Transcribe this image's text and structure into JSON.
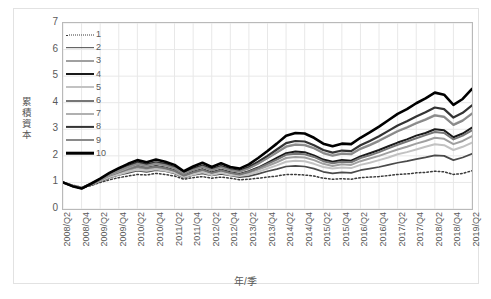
{
  "chart_data": {
    "type": "line",
    "title": "",
    "xlabel": "年/季",
    "ylabel": "累積資本",
    "ylim": [
      0,
      7
    ],
    "yticks": [
      0,
      1,
      2,
      3,
      4,
      5,
      6,
      7
    ],
    "grid": true,
    "legend_position": "top-left-inside",
    "legend_entries": [
      "1",
      "2",
      "3",
      "4",
      "5",
      "6",
      "7",
      "8",
      "9",
      "10"
    ],
    "categories": [
      "2008/Q2",
      "2008/Q3",
      "2008/Q4",
      "2009/Q1",
      "2009/Q2",
      "2009/Q3",
      "2009/Q4",
      "2010/Q1",
      "2010/Q2",
      "2010/Q3",
      "2010/Q4",
      "2011/Q1",
      "2011/Q2",
      "2011/Q3",
      "2011/Q4",
      "2012/Q1",
      "2012/Q2",
      "2012/Q3",
      "2012/Q4",
      "2013/Q1",
      "2013/Q2",
      "2013/Q3",
      "2013/Q4",
      "2014/Q1",
      "2014/Q2",
      "2014/Q3",
      "2014/Q4",
      "2015/Q1",
      "2015/Q2",
      "2015/Q3",
      "2015/Q4",
      "2016/Q1",
      "2016/Q2",
      "2016/Q3",
      "2016/Q4",
      "2017/Q1",
      "2017/Q2",
      "2017/Q3",
      "2017/Q4",
      "2018/Q1",
      "2018/Q2",
      "2018/Q3",
      "2018/Q4",
      "2019/Q1",
      "2019/Q2"
    ],
    "tick_labels": [
      "2008/Q2",
      "2008/Q4",
      "2009/Q2",
      "2009/Q4",
      "2010/Q2",
      "2010/Q4",
      "2011/Q2",
      "2011/Q4",
      "2012/Q2",
      "2012/Q4",
      "2013/Q2",
      "2013/Q4",
      "2014/Q2",
      "2014/Q4",
      "2015/Q2",
      "2015/Q4",
      "2016/Q2",
      "2016/Q4",
      "2017/Q2",
      "2017/Q4",
      "2018/Q2",
      "2018/Q4",
      "2019/Q2"
    ],
    "series": [
      {
        "name": "1",
        "style": "dotted",
        "color": "#3a3a3a",
        "width": 1.5,
        "values": [
          1.0,
          0.9,
          0.82,
          0.88,
          1.0,
          1.1,
          1.18,
          1.24,
          1.3,
          1.28,
          1.34,
          1.3,
          1.24,
          1.12,
          1.18,
          1.22,
          1.16,
          1.2,
          1.16,
          1.1,
          1.12,
          1.16,
          1.2,
          1.24,
          1.3,
          1.3,
          1.28,
          1.24,
          1.16,
          1.12,
          1.14,
          1.12,
          1.18,
          1.2,
          1.22,
          1.26,
          1.3,
          1.32,
          1.36,
          1.38,
          1.42,
          1.4,
          1.3,
          1.34,
          1.44
        ]
      },
      {
        "name": "2",
        "style": "solid",
        "color": "#4a4a4a",
        "width": 1.7,
        "values": [
          1.0,
          0.88,
          0.8,
          0.9,
          1.04,
          1.18,
          1.28,
          1.36,
          1.44,
          1.4,
          1.46,
          1.42,
          1.34,
          1.18,
          1.28,
          1.34,
          1.26,
          1.32,
          1.26,
          1.2,
          1.24,
          1.32,
          1.42,
          1.5,
          1.6,
          1.62,
          1.6,
          1.52,
          1.4,
          1.34,
          1.38,
          1.36,
          1.46,
          1.52,
          1.58,
          1.66,
          1.74,
          1.8,
          1.88,
          1.94,
          2.02,
          2.0,
          1.84,
          1.94,
          2.08
        ]
      },
      {
        "name": "3",
        "style": "solid",
        "color": "#a0a0a0",
        "width": 2.0,
        "values": [
          1.0,
          0.88,
          0.79,
          0.92,
          1.08,
          1.24,
          1.36,
          1.46,
          1.56,
          1.5,
          1.56,
          1.5,
          1.42,
          1.24,
          1.36,
          1.44,
          1.34,
          1.42,
          1.34,
          1.28,
          1.36,
          1.48,
          1.62,
          1.76,
          1.92,
          1.96,
          1.94,
          1.84,
          1.7,
          1.62,
          1.68,
          1.66,
          1.8,
          1.9,
          2.0,
          2.12,
          2.24,
          2.34,
          2.46,
          2.56,
          2.68,
          2.64,
          2.44,
          2.56,
          2.74
        ]
      },
      {
        "name": "4",
        "style": "solid",
        "color": "#1a1a1a",
        "width": 2.0,
        "values": [
          1.0,
          0.87,
          0.78,
          0.93,
          1.1,
          1.28,
          1.42,
          1.54,
          1.64,
          1.56,
          1.62,
          1.56,
          1.46,
          1.26,
          1.4,
          1.5,
          1.38,
          1.48,
          1.38,
          1.32,
          1.42,
          1.56,
          1.74,
          1.92,
          2.1,
          2.16,
          2.14,
          2.02,
          1.86,
          1.78,
          1.84,
          1.82,
          1.98,
          2.1,
          2.22,
          2.36,
          2.5,
          2.62,
          2.76,
          2.86,
          3.0,
          2.96,
          2.7,
          2.84,
          3.06
        ]
      },
      {
        "name": "5",
        "style": "solid",
        "color": "#c2c2c2",
        "width": 2.0,
        "values": [
          1.0,
          0.89,
          0.8,
          0.92,
          1.06,
          1.2,
          1.3,
          1.4,
          1.48,
          1.44,
          1.5,
          1.44,
          1.36,
          1.2,
          1.3,
          1.38,
          1.28,
          1.36,
          1.28,
          1.24,
          1.3,
          1.4,
          1.52,
          1.64,
          1.78,
          1.82,
          1.8,
          1.7,
          1.58,
          1.52,
          1.56,
          1.54,
          1.66,
          1.74,
          1.84,
          1.94,
          2.06,
          2.14,
          2.24,
          2.34,
          2.44,
          2.4,
          2.22,
          2.34,
          2.5
        ]
      },
      {
        "name": "6",
        "style": "solid",
        "color": "#767676",
        "width": 2.0,
        "values": [
          1.0,
          0.88,
          0.79,
          0.93,
          1.09,
          1.26,
          1.38,
          1.5,
          1.6,
          1.54,
          1.6,
          1.54,
          1.44,
          1.26,
          1.38,
          1.48,
          1.36,
          1.46,
          1.36,
          1.3,
          1.4,
          1.54,
          1.7,
          1.86,
          2.04,
          2.08,
          2.06,
          1.96,
          1.8,
          1.72,
          1.78,
          1.76,
          1.92,
          2.02,
          2.14,
          2.28,
          2.42,
          2.54,
          2.66,
          2.78,
          2.9,
          2.86,
          2.62,
          2.76,
          2.96
        ]
      },
      {
        "name": "7",
        "style": "solid",
        "color": "#b0b0b0",
        "width": 2.0,
        "values": [
          1.0,
          0.89,
          0.81,
          0.94,
          1.1,
          1.28,
          1.42,
          1.56,
          1.68,
          1.62,
          1.7,
          1.64,
          1.54,
          1.34,
          1.48,
          1.6,
          1.46,
          1.58,
          1.48,
          1.42,
          1.54,
          1.72,
          1.92,
          2.14,
          2.36,
          2.44,
          2.42,
          2.3,
          2.12,
          2.02,
          2.1,
          2.08,
          2.28,
          2.42,
          2.58,
          2.76,
          2.94,
          3.08,
          3.24,
          3.38,
          3.54,
          3.48,
          3.18,
          3.34,
          3.6
        ]
      },
      {
        "name": "8",
        "style": "solid",
        "color": "#333333",
        "width": 2.2,
        "values": [
          1.0,
          0.87,
          0.78,
          0.94,
          1.12,
          1.32,
          1.48,
          1.62,
          1.76,
          1.68,
          1.76,
          1.7,
          1.58,
          1.36,
          1.52,
          1.64,
          1.5,
          1.62,
          1.5,
          1.44,
          1.58,
          1.78,
          2.0,
          2.24,
          2.48,
          2.56,
          2.54,
          2.4,
          2.22,
          2.12,
          2.2,
          2.18,
          2.4,
          2.56,
          2.74,
          2.94,
          3.14,
          3.3,
          3.48,
          3.64,
          3.82,
          3.76,
          3.44,
          3.62,
          3.9
        ]
      },
      {
        "name": "9",
        "style": "solid",
        "color": "#8a8a8a",
        "width": 2.0,
        "values": [
          1.0,
          0.88,
          0.79,
          0.93,
          1.1,
          1.29,
          1.44,
          1.58,
          1.7,
          1.63,
          1.71,
          1.65,
          1.54,
          1.33,
          1.47,
          1.59,
          1.46,
          1.57,
          1.46,
          1.4,
          1.53,
          1.71,
          1.91,
          2.12,
          2.34,
          2.42,
          2.4,
          2.28,
          2.1,
          2.0,
          2.08,
          2.06,
          2.26,
          2.4,
          2.56,
          2.74,
          2.92,
          3.06,
          3.22,
          3.36,
          3.52,
          3.46,
          3.16,
          3.32,
          3.58
        ]
      },
      {
        "name": "10",
        "style": "solid",
        "color": "#000000",
        "width": 2.6,
        "values": [
          1.0,
          0.86,
          0.77,
          0.95,
          1.14,
          1.36,
          1.54,
          1.7,
          1.84,
          1.76,
          1.86,
          1.78,
          1.66,
          1.42,
          1.6,
          1.74,
          1.58,
          1.72,
          1.58,
          1.52,
          1.68,
          1.92,
          2.18,
          2.46,
          2.76,
          2.86,
          2.84,
          2.68,
          2.46,
          2.36,
          2.46,
          2.44,
          2.68,
          2.88,
          3.1,
          3.34,
          3.58,
          3.76,
          3.98,
          4.16,
          4.38,
          4.3,
          3.92,
          4.14,
          4.52
        ]
      }
    ]
  },
  "axes": {
    "y_title": "累積資本",
    "x_title": "年/季",
    "y_tick_labels": [
      "7",
      "6",
      "5",
      "4",
      "3",
      "2",
      "1",
      "0"
    ]
  },
  "legend": {
    "items": [
      {
        "label": "1"
      },
      {
        "label": "2"
      },
      {
        "label": "3"
      },
      {
        "label": "4"
      },
      {
        "label": "5"
      },
      {
        "label": "6"
      },
      {
        "label": "7"
      },
      {
        "label": "8"
      },
      {
        "label": "9"
      },
      {
        "label": "10"
      }
    ]
  },
  "colors": {
    "grid": "#e8e8e8",
    "plot_border": "#b9b9b9",
    "figure_border": "#e2e2e2",
    "axis_text": "#595959",
    "background": "#ffffff"
  }
}
